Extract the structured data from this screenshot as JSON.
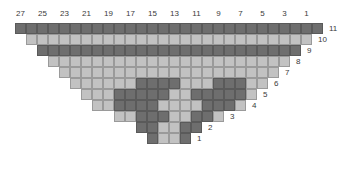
{
  "figure": {
    "type": "cellular-automaton-triangle-grid",
    "columns": 28,
    "rows": 11,
    "cell_size_px": 11,
    "colors": {
      "dark": "#6e6e6e",
      "light": "#c2c2c2",
      "grid_line": "#8a8a8a",
      "label": "#3a3a3a",
      "background": "#ffffff"
    }
  },
  "column_labels": [
    "27",
    "25",
    "23",
    "21",
    "19",
    "17",
    "15",
    "13",
    "11",
    "9",
    "7",
    "5",
    "3",
    "1"
  ],
  "row_labels": [
    "11",
    "10",
    "9",
    "8",
    "7",
    "6",
    "5",
    "4",
    "3",
    "2",
    "1"
  ],
  "chart_data": {
    "type": "heatmap",
    "title": "",
    "xlabel": "",
    "ylabel": "",
    "x_tick_labels": [
      "27",
      "25",
      "23",
      "21",
      "19",
      "17",
      "15",
      "13",
      "11",
      "9",
      "7",
      "5",
      "3",
      "1"
    ],
    "y_tick_labels": [
      "11",
      "10",
      "9",
      "8",
      "7",
      "6",
      "5",
      "4",
      "3",
      "2",
      "1"
    ],
    "legend": [
      "dark",
      "light"
    ],
    "grid": true,
    "note": "Row 11 is the widest (28 cells); each lower row is inset by one cell on each side, forming an inverted triangle. Value 1 = dark cell, 0 = light cell.",
    "rows": [
      {
        "label": "11",
        "offset": 0,
        "width": 28,
        "values": [
          1,
          1,
          1,
          1,
          1,
          1,
          1,
          1,
          1,
          1,
          1,
          1,
          1,
          1,
          1,
          1,
          1,
          1,
          1,
          1,
          1,
          1,
          1,
          1,
          1,
          1,
          1,
          1
        ]
      },
      {
        "label": "10",
        "offset": 1,
        "width": 26,
        "values": [
          0,
          0,
          0,
          0,
          0,
          0,
          0,
          0,
          0,
          0,
          0,
          0,
          0,
          0,
          0,
          0,
          0,
          0,
          0,
          0,
          0,
          0,
          0,
          0,
          0,
          0
        ]
      },
      {
        "label": "9",
        "offset": 2,
        "width": 24,
        "values": [
          1,
          1,
          1,
          1,
          1,
          1,
          1,
          1,
          1,
          1,
          1,
          1,
          1,
          1,
          1,
          1,
          1,
          1,
          1,
          1,
          1,
          1,
          1,
          1
        ]
      },
      {
        "label": "8",
        "offset": 3,
        "width": 22,
        "values": [
          0,
          0,
          0,
          0,
          0,
          0,
          0,
          0,
          0,
          0,
          0,
          0,
          0,
          0,
          0,
          0,
          0,
          0,
          0,
          0,
          0,
          0
        ]
      },
      {
        "label": "7",
        "offset": 4,
        "width": 20,
        "values": [
          0,
          0,
          0,
          0,
          0,
          0,
          0,
          0,
          0,
          0,
          0,
          0,
          0,
          0,
          0,
          0,
          0,
          0,
          0,
          0
        ]
      },
      {
        "label": "6",
        "offset": 5,
        "width": 18,
        "values": [
          0,
          0,
          0,
          0,
          0,
          0,
          1,
          1,
          1,
          1,
          0,
          0,
          0,
          1,
          1,
          1,
          0,
          0
        ]
      },
      {
        "label": "5",
        "offset": 6,
        "width": 16,
        "values": [
          0,
          0,
          0,
          1,
          1,
          1,
          1,
          1,
          0,
          0,
          1,
          1,
          1,
          1,
          1,
          0
        ]
      },
      {
        "label": "4",
        "offset": 7,
        "width": 14,
        "values": [
          0,
          0,
          1,
          1,
          1,
          1,
          0,
          0,
          0,
          0,
          1,
          1,
          1,
          0
        ]
      },
      {
        "label": "3",
        "offset": 9,
        "width": 10,
        "values": [
          0,
          0,
          1,
          1,
          1,
          0,
          0,
          1,
          1,
          0
        ]
      },
      {
        "label": "2",
        "offset": 11,
        "width": 6,
        "values": [
          1,
          1,
          0,
          0,
          1,
          1
        ]
      },
      {
        "label": "1",
        "offset": 12,
        "width": 4,
        "values": [
          1,
          0,
          0,
          1
        ]
      }
    ]
  }
}
